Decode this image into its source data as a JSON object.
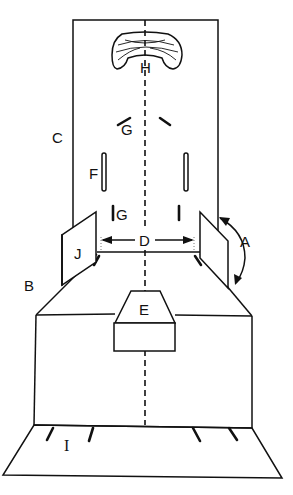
{
  "figure": {
    "type": "schematic line drawing",
    "labels": {
      "A": "A",
      "B": "B",
      "C": "C",
      "D": "D",
      "E": "E",
      "F": "F",
      "G_upper": "G",
      "G_lower": "G",
      "H": "H",
      "I_lower": "I",
      "I_side": "I",
      "J": "J"
    },
    "colors": {
      "ink": "#111111",
      "background": "#ffffff"
    }
  }
}
